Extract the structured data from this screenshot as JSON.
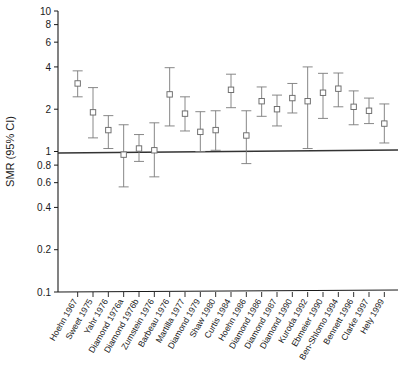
{
  "chart_data": {
    "type": "scatter",
    "title": "",
    "xlabel": "",
    "ylabel": "SMR (95% CI)",
    "yscale": "log",
    "ylim": [
      0.1,
      10
    ],
    "yticks": [
      0.1,
      0.2,
      0.4,
      0.6,
      0.8,
      1,
      2,
      4,
      6,
      8,
      10
    ],
    "ytick_labels": [
      "0.1",
      "0.2",
      "0.4",
      "0.6",
      "0.8",
      "1",
      "2",
      "4",
      "6",
      "8",
      "10"
    ],
    "grid": false,
    "legend": "none",
    "reference_line": 1.0,
    "marker": "open-square",
    "categories": [
      "Hoehn 1967",
      "Sweet 1975",
      "Yahr 1976",
      "Diamond 1976a",
      "Diamond 1976b",
      "Zumstein 1976",
      "Barbeau 1976",
      "Martilla 1977",
      "Diamond 1979",
      "Shaw 1980",
      "Curtis 1984",
      "Hoehn 1986",
      "Diamond 1987",
      "Diamond 1990",
      "Kuroda 1992",
      "Ebmeier 1990",
      "Ben-Shlomo 1994",
      "Bennett 1996",
      "Clarke 1997",
      "Hely 1999"
    ],
    "points": [
      {
        "label": "Hoehn 1967",
        "smr": 3.05,
        "lo": 2.45,
        "hi": 3.75
      },
      {
        "label": "Sweet 1975",
        "smr": 1.9,
        "lo": 1.25,
        "hi": 2.85
      },
      {
        "label": "Yahr 1976",
        "smr": 1.42,
        "lo": 1.05,
        "hi": 1.8
      },
      {
        "label": "Diamond 1976a",
        "smr": 0.95,
        "lo": 0.56,
        "hi": 1.55
      },
      {
        "label": "Diamond 1976b",
        "smr": 1.05,
        "lo": 0.85,
        "hi": 1.32
      },
      {
        "label": "Zumstein 1976",
        "smr": 1.02,
        "lo": 0.66,
        "hi": 1.6
      },
      {
        "label": "Barbeau 1976",
        "smr": 2.55,
        "lo": 1.52,
        "hi": 3.95
      },
      {
        "label": "Martilla 1977",
        "smr": 1.86,
        "lo": 1.4,
        "hi": 2.45
      },
      {
        "label": "Diamond 1979",
        "smr": 1.38,
        "lo": 1.0,
        "hi": 1.92
      },
      {
        "label": "Shaw 1980",
        "smr": 1.42,
        "lo": 1.02,
        "hi": 1.95
      },
      {
        "label": "Curtis 1984",
        "smr": 2.75,
        "lo": 2.05,
        "hi": 3.55
      },
      {
        "label": "Hoehn 1986",
        "smr": 1.3,
        "lo": 0.82,
        "hi": 1.95
      },
      {
        "label": "Diamond 1986",
        "smr": 2.28,
        "lo": 1.78,
        "hi": 2.88
      },
      {
        "label": "Diamond 1987",
        "smr": 2.0,
        "lo": 1.52,
        "hi": 2.52
      },
      {
        "label": "Diamond 1990",
        "smr": 2.4,
        "lo": 1.88,
        "hi": 3.05
      },
      {
        "label": "Kuroda 1990",
        "smr": 2.28,
        "lo": 1.05,
        "hi": 4.0
      },
      {
        "label": "Ebmeier 1992",
        "smr": 2.62,
        "lo": 1.72,
        "hi": 3.6
      },
      {
        "label": "Ben-Shlomo 1990",
        "smr": 2.8,
        "lo": 2.08,
        "hi": 3.62
      },
      {
        "label": "Bennett 1994",
        "smr": 2.08,
        "lo": 1.55,
        "hi": 2.7
      },
      {
        "label": "Clarke 1996",
        "smr": 1.95,
        "lo": 1.58,
        "hi": 2.4
      },
      {
        "label": "Hely 1999",
        "smr": 1.58,
        "lo": 1.15,
        "hi": 2.18
      }
    ],
    "xtick_labels": [
      "Hoehn 1967",
      "Sweet 1975",
      "Yahr 1976",
      "Diamond 1976a",
      "Diamond 1976b",
      "Zumstein 1976",
      "Barbeau 1976",
      "Martilla 1977",
      "Diamond 1979",
      "Shaw 1980",
      "Curtis 1984",
      "Hoehn 1986",
      "Diamond 1986",
      "Diamond 1987",
      "Diamond 1990",
      "Kuroda 1992",
      "Ebmeier 1990",
      "Ben-Shlomo 1994",
      "Bennett 1996",
      "Clarke 1997",
      "Hely 1999"
    ],
    "colors": {
      "axis": "#1a1a1a",
      "marker_stroke": "#6b6b6b",
      "whisker": "#7a7a7a",
      "reference_line": "#333333",
      "background": "#ffffff"
    }
  }
}
